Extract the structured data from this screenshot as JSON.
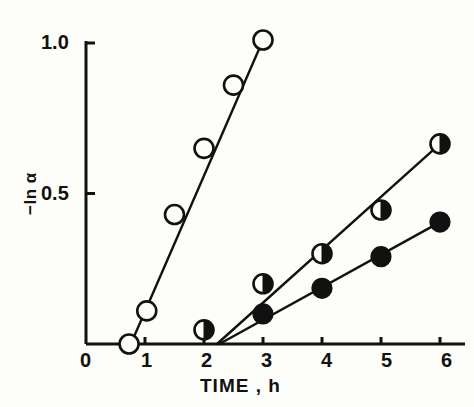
{
  "figure": {
    "background_color": "#fdfdfa",
    "ink_color": "#111111",
    "width": 474,
    "height": 407
  },
  "axes": {
    "x_title": "TIME , h",
    "y_title": "−ln α",
    "x_ticks": [
      "0",
      "1",
      "2",
      "3",
      "4",
      "5",
      "6"
    ],
    "y_ticks": [
      "0.5",
      "1.0"
    ]
  },
  "chart_data": {
    "type": "scatter",
    "title": "",
    "xlabel": "TIME , h",
    "ylabel": "-ln α",
    "xlim": [
      0,
      6.2
    ],
    "ylim": [
      0,
      1.06
    ],
    "xticks": [
      0,
      1,
      2,
      3,
      4,
      5,
      6
    ],
    "yticks": [
      0.5,
      1.0
    ],
    "grid": false,
    "legend": "none",
    "series": [
      {
        "name": "open-circles",
        "marker": "open-circle",
        "marker_fill": "#fdfdfa",
        "marker_edge": "#111111",
        "line": true,
        "x": [
          0.73,
          1.03,
          1.5,
          2.0,
          2.5,
          3.0
        ],
        "y": [
          0.0,
          0.11,
          0.43,
          0.65,
          0.86,
          1.01
        ],
        "fit_line": {
          "x0": 0.76,
          "y0": 0.0,
          "x1": 3.0,
          "y1": 1.01
        }
      },
      {
        "name": "half-filled-circles",
        "marker": "half-filled-circle",
        "marker_fill": "#111111",
        "marker_edge": "#111111",
        "line": true,
        "x": [
          2.0,
          3.0,
          4.0,
          5.0,
          6.0
        ],
        "y": [
          0.047,
          0.2,
          0.3,
          0.445,
          0.665
        ],
        "fit_line": {
          "x0": 2.22,
          "y0": 0.0,
          "x1": 6.0,
          "y1": 0.665
        }
      },
      {
        "name": "filled-circles",
        "marker": "filled-circle",
        "marker_fill": "#111111",
        "marker_edge": "#111111",
        "line": true,
        "x": [
          3.0,
          4.0,
          5.0,
          6.0
        ],
        "y": [
          0.1,
          0.185,
          0.29,
          0.405
        ],
        "fit_line": {
          "x0": 2.26,
          "y0": 0.0,
          "x1": 6.0,
          "y1": 0.405
        }
      }
    ]
  }
}
